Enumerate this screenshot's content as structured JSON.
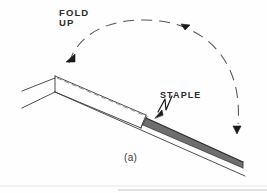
{
  "figure": {
    "caption": "(a)",
    "background_color": "#fefefe",
    "line_color": "#3a3a3a",
    "band_fill_color": "#6e6e6e",
    "band_edge_color": "#2a2a2a",
    "text_color": "#2b2b2b",
    "labels": {
      "fold": "FOLD",
      "up": "UP",
      "staple": "STAPLE"
    },
    "annotations": [
      {
        "name": "fold-up-label",
        "text": "FOLD\nUP",
        "x": 59,
        "y": 8
      },
      {
        "name": "staple-label",
        "text": "STAPLE",
        "x": 160,
        "y": 91
      },
      {
        "name": "figure-caption",
        "text": "(a)",
        "x": 124,
        "y": 153
      }
    ],
    "elements": [
      "folded-sheet",
      "fold-flap",
      "dashed-fold-line",
      "shaded-staple-band",
      "rotation-arc",
      "arc-arrow-left",
      "arc-arrow-right",
      "staple-leader"
    ]
  }
}
